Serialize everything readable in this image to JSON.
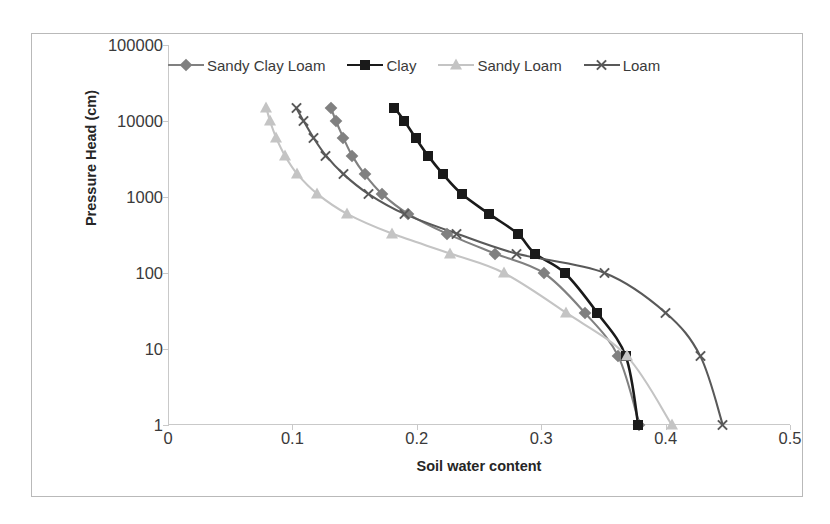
{
  "figure": {
    "background": "#ffffff",
    "frame_color": "#b9b9b9"
  },
  "axes": {
    "xlabel": "Soil water content",
    "ylabel": "Pressure Head (cm)",
    "xticks": [
      "0",
      "0.1",
      "0.2",
      "0.3",
      "0.4",
      "0.5"
    ],
    "yticks": [
      "100000",
      "10000",
      "1000",
      "100",
      "10",
      "1"
    ]
  },
  "legend": {
    "position": "top-inside",
    "items": [
      {
        "label": "Sandy Clay Loam",
        "marker": "diamond",
        "color": "#808080"
      },
      {
        "label": "Clay",
        "marker": "square",
        "color": "#1a1a1a"
      },
      {
        "label": "Sandy Loam",
        "marker": "triangle",
        "color": "#c4c4c4"
      },
      {
        "label": "Loam",
        "marker": "x",
        "color": "#595959"
      }
    ]
  },
  "chart_data": {
    "type": "line",
    "title": "",
    "xlabel": "Soil water content",
    "ylabel": "Pressure Head (cm)",
    "xlim": [
      0,
      0.5
    ],
    "ylim": [
      1,
      100000
    ],
    "yscale": "log",
    "grid": false,
    "legend_position": "top-inside",
    "series": [
      {
        "name": "Sandy Clay Loam",
        "marker": "diamond",
        "color": "#808080",
        "x": [
          0.131,
          0.135,
          0.141,
          0.148,
          0.158,
          0.172,
          0.193,
          0.224,
          0.263,
          0.302,
          0.335,
          0.362,
          0.379
        ],
        "y": [
          15000,
          10000,
          6000,
          3500,
          2000,
          1100,
          600,
          330,
          180,
          100,
          30,
          8,
          1
        ]
      },
      {
        "name": "Clay",
        "marker": "square",
        "color": "#1a1a1a",
        "x": [
          0.182,
          0.19,
          0.199,
          0.209,
          0.221,
          0.236,
          0.258,
          0.281,
          0.295,
          0.319,
          0.345,
          0.368,
          0.378
        ],
        "y": [
          15000,
          10000,
          6000,
          3500,
          2000,
          1100,
          600,
          330,
          180,
          100,
          30,
          8,
          1
        ]
      },
      {
        "name": "Sandy Loam",
        "marker": "triangle",
        "color": "#c4c4c4",
        "x": [
          0.079,
          0.082,
          0.087,
          0.094,
          0.104,
          0.12,
          0.144,
          0.18,
          0.227,
          0.27,
          0.32,
          0.369,
          0.405
        ],
        "y": [
          15000,
          10000,
          6000,
          3500,
          2000,
          1100,
          600,
          330,
          180,
          100,
          30,
          8,
          1
        ]
      },
      {
        "name": "Loam",
        "marker": "x",
        "color": "#595959",
        "x": [
          0.103,
          0.109,
          0.117,
          0.127,
          0.141,
          0.161,
          0.19,
          0.232,
          0.28,
          0.351,
          0.4,
          0.428,
          0.446
        ],
        "y": [
          15000,
          10000,
          6000,
          3500,
          2000,
          1100,
          600,
          330,
          180,
          100,
          30,
          8,
          1
        ]
      }
    ]
  }
}
